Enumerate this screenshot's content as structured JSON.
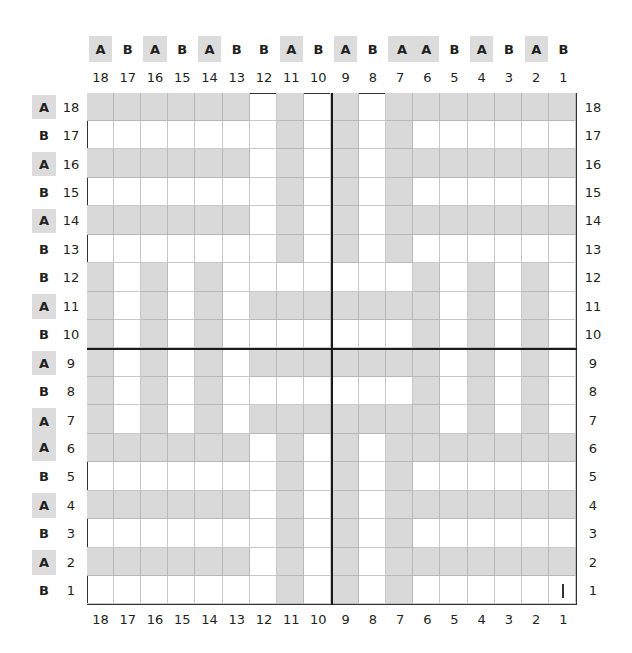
{
  "diagram": {
    "title": "",
    "columns": [
      18,
      17,
      16,
      15,
      14,
      13,
      12,
      11,
      10,
      9,
      8,
      7,
      6,
      5,
      4,
      3,
      2,
      1
    ],
    "rows": [
      18,
      17,
      16,
      15,
      14,
      13,
      12,
      11,
      10,
      9,
      8,
      7,
      6,
      5,
      4,
      3,
      2,
      1
    ],
    "column_labels": [
      "A",
      "B",
      "A",
      "B",
      "A",
      "B",
      "B",
      "A",
      "B",
      "A",
      "B",
      "A",
      "A",
      "B",
      "A",
      "B",
      "A",
      "B"
    ],
    "row_labels": [
      "A",
      "B",
      "A",
      "B",
      "A",
      "B",
      "B",
      "A",
      "B",
      "A",
      "B",
      "A",
      "A",
      "B",
      "A",
      "B",
      "A",
      "B"
    ],
    "shaded_label": "A",
    "colors": {
      "shade": "#d9d9d9",
      "label_shade": "#dcdcdc",
      "grid_line": "#c8c8c8",
      "axis_line": "#1a1a1a",
      "text": "#231f20"
    },
    "pattern_legend": "1 = shaded cell, 0 = white cell; rows listed 18→1, columns listed 18→1",
    "cells": [
      [
        1,
        1,
        1,
        1,
        1,
        1,
        0,
        1,
        0,
        1,
        0,
        1,
        1,
        1,
        1,
        1,
        1,
        1
      ],
      [
        0,
        0,
        0,
        0,
        0,
        0,
        0,
        1,
        0,
        1,
        0,
        1,
        0,
        0,
        0,
        0,
        0,
        0
      ],
      [
        1,
        1,
        1,
        1,
        1,
        1,
        0,
        1,
        0,
        1,
        0,
        1,
        1,
        1,
        1,
        1,
        1,
        1
      ],
      [
        0,
        0,
        0,
        0,
        0,
        0,
        0,
        1,
        0,
        1,
        0,
        1,
        0,
        0,
        0,
        0,
        0,
        0
      ],
      [
        1,
        1,
        1,
        1,
        1,
        1,
        0,
        1,
        0,
        1,
        0,
        1,
        1,
        1,
        1,
        1,
        1,
        1
      ],
      [
        0,
        0,
        0,
        0,
        0,
        0,
        0,
        1,
        0,
        1,
        0,
        1,
        0,
        0,
        0,
        0,
        0,
        0
      ],
      [
        1,
        0,
        1,
        0,
        1,
        0,
        0,
        0,
        0,
        0,
        0,
        0,
        1,
        0,
        1,
        0,
        1,
        0
      ],
      [
        1,
        0,
        1,
        0,
        1,
        0,
        1,
        1,
        1,
        1,
        1,
        1,
        1,
        0,
        1,
        0,
        1,
        0
      ],
      [
        1,
        0,
        1,
        0,
        1,
        0,
        0,
        0,
        0,
        0,
        0,
        0,
        1,
        0,
        1,
        0,
        1,
        0
      ],
      [
        1,
        0,
        1,
        0,
        1,
        0,
        1,
        1,
        1,
        1,
        1,
        1,
        1,
        0,
        1,
        0,
        1,
        0
      ],
      [
        1,
        0,
        1,
        0,
        1,
        0,
        0,
        0,
        0,
        0,
        0,
        0,
        1,
        0,
        1,
        0,
        1,
        0
      ],
      [
        1,
        0,
        1,
        0,
        1,
        0,
        1,
        1,
        1,
        1,
        1,
        1,
        1,
        0,
        1,
        0,
        1,
        0
      ],
      [
        1,
        1,
        1,
        1,
        1,
        1,
        0,
        1,
        0,
        1,
        0,
        1,
        1,
        1,
        1,
        1,
        1,
        1
      ],
      [
        0,
        0,
        0,
        0,
        0,
        0,
        0,
        1,
        0,
        1,
        0,
        1,
        0,
        0,
        0,
        0,
        0,
        0
      ],
      [
        1,
        1,
        1,
        1,
        1,
        1,
        0,
        1,
        0,
        1,
        0,
        1,
        1,
        1,
        1,
        1,
        1,
        1
      ],
      [
        0,
        0,
        0,
        0,
        0,
        0,
        0,
        1,
        0,
        1,
        0,
        1,
        0,
        0,
        0,
        0,
        0,
        0
      ],
      [
        1,
        1,
        1,
        1,
        1,
        1,
        0,
        1,
        0,
        1,
        0,
        1,
        1,
        1,
        1,
        1,
        1,
        1
      ],
      [
        0,
        0,
        0,
        0,
        0,
        0,
        0,
        1,
        0,
        1,
        0,
        1,
        0,
        0,
        0,
        0,
        0,
        0
      ]
    ],
    "center_lines": {
      "vertical_after_column": 10,
      "horizontal_after_row": 10
    },
    "marker": {
      "symbol": "|",
      "row": 1,
      "column": 1
    }
  }
}
